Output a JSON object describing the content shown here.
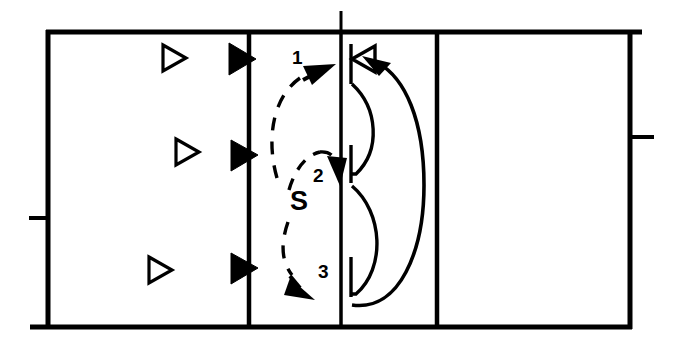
{
  "figure": {
    "title": "",
    "type": "schematic-cross-section-diagram",
    "background_color": "#ffffff",
    "stroke_color": "#000000"
  },
  "labels": {
    "path_1": "1",
    "path_2": "2",
    "path_3": "3",
    "source": "S"
  },
  "annotations": [
    {
      "name": "flow-label-1",
      "text": "1",
      "x": 295,
      "y": 58
    },
    {
      "name": "flow-label-2",
      "text": "2",
      "x": 315,
      "y": 172
    },
    {
      "name": "source-label-s",
      "text": "S",
      "x": 292,
      "y": 196
    },
    {
      "name": "flow-label-3",
      "text": "3",
      "x": 319,
      "y": 272
    }
  ],
  "frame": {
    "left": 48,
    "right": 630,
    "top": 32,
    "bottom": 327,
    "stroke_width": 4
  },
  "dividers": [
    {
      "name": "divider-left-wall",
      "x": 249,
      "stroke_width": 4,
      "extends_above": false
    },
    {
      "name": "divider-mid-wall",
      "x": 341,
      "stroke_width": 3,
      "extends_above": true
    },
    {
      "name": "divider-right-wall",
      "x": 437,
      "stroke_width": 4,
      "extends_above": false
    }
  ],
  "ticks": [
    {
      "name": "tick-left",
      "x1": 30,
      "x2": 48,
      "y": 218
    },
    {
      "name": "tick-right",
      "x1": 630,
      "x2": 652,
      "y": 137
    },
    {
      "name": "tick-top-mid",
      "x": 341,
      "y1": 12,
      "y2": 32
    }
  ],
  "hollow_triangles": [
    {
      "name": "hollow-triangle-top",
      "x": 162,
      "y": 58
    },
    {
      "name": "hollow-triangle-middle",
      "x": 175,
      "y": 152
    },
    {
      "name": "hollow-triangle-bottom",
      "x": 148,
      "y": 270
    }
  ],
  "filled_triangles": [
    {
      "name": "filled-triangle-top",
      "x": 249,
      "y": 59
    },
    {
      "name": "filled-triangle-middle",
      "x": 249,
      "y": 155
    },
    {
      "name": "filled-triangle-bottom",
      "x": 249,
      "y": 268
    }
  ],
  "dashed_paths": [
    {
      "name": "dashed-path-1",
      "label": "1",
      "direction": "up-right"
    },
    {
      "name": "dashed-path-2",
      "label": "2",
      "direction": "right"
    },
    {
      "name": "dashed-path-3",
      "label": "3",
      "direction": "down-right"
    }
  ],
  "brace_stubs": [
    {
      "name": "brace-stub-top",
      "x": 351,
      "y1": 45,
      "y2": 83
    },
    {
      "name": "brace-stub-middle",
      "x": 351,
      "y1": 146,
      "y2": 182
    },
    {
      "name": "brace-stub-bottom",
      "x": 351,
      "y1": 258,
      "y2": 296
    }
  ],
  "return_arrow": {
    "name": "return-curve-arrow",
    "head_x": 368,
    "head_y": 59,
    "style": "solid-curve-with-filled-arrowhead"
  },
  "open_triangle_marker": {
    "name": "open-triangle-marker",
    "x": 357,
    "y": 59,
    "direction": "left"
  }
}
